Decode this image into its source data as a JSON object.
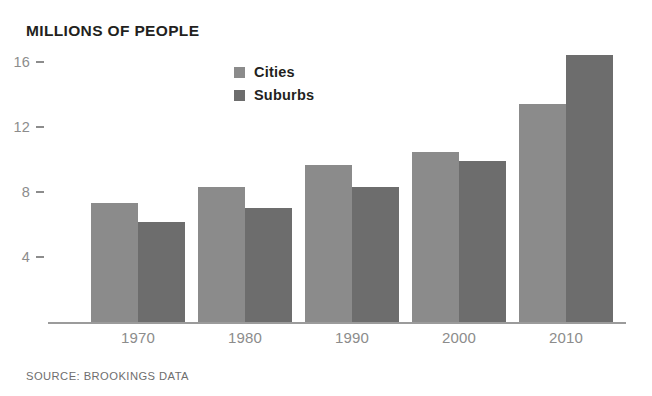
{
  "chart_data": {
    "type": "bar",
    "title": "MILLIONS OF PEOPLE",
    "xlabel": "",
    "ylabel": "MILLIONS OF PEOPLE",
    "categories": [
      "1970",
      "1980",
      "1990",
      "2000",
      "2010"
    ],
    "series": [
      {
        "name": "Cities",
        "color": "#8b8b8b",
        "values": [
          7.4,
          8.4,
          9.7,
          10.5,
          13.5
        ]
      },
      {
        "name": "Suburbs",
        "color": "#6d6d6d",
        "values": [
          6.2,
          7.1,
          8.4,
          10.0,
          16.5
        ]
      }
    ],
    "yticks": [
      16,
      12,
      8,
      4
    ],
    "ylim": [
      0,
      17.4
    ],
    "grid": false,
    "legend_position": "top-center",
    "source": "SOURCE: BROOKINGS DATA"
  },
  "legend": {
    "items": [
      {
        "label": "Cities"
      },
      {
        "label": "Suburbs"
      }
    ]
  },
  "colors": {
    "cities": "#8b8b8b",
    "suburbs": "#6d6d6d",
    "axis": "#9b9b9b",
    "tick_text": "#8c8c8c",
    "title_text": "#231f20",
    "source_text": "#6e6e6e",
    "background": "#ffffff"
  }
}
